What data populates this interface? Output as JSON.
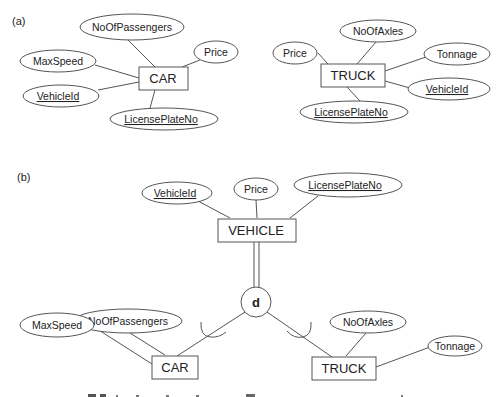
{
  "diagram": {
    "part_a": {
      "label": "(a)",
      "car": {
        "name": "CAR",
        "attributes": {
          "no_of_passengers": "NoOfPassengers",
          "max_speed": "MaxSpeed",
          "price": "Price",
          "vehicle_id": "VehicleId",
          "license_plate_no": "LicensePlateNo"
        },
        "key_attributes": [
          "VehicleId",
          "LicensePlateNo"
        ]
      },
      "truck": {
        "name": "TRUCK",
        "attributes": {
          "price": "Price",
          "no_of_axles": "NoOfAxles",
          "tonnage": "Tonnage",
          "vehicle_id": "VehicleId",
          "license_plate_no": "LicensePlateNo"
        },
        "key_attributes": [
          "VehicleId",
          "LicensePlateNo"
        ]
      }
    },
    "part_b": {
      "label": "(b)",
      "vehicle": {
        "name": "VEHICLE",
        "attributes": {
          "vehicle_id": "VehicleId",
          "price": "Price",
          "license_plate_no": "LicensePlateNo"
        },
        "key_attributes": [
          "VehicleId",
          "LicensePlateNo"
        ]
      },
      "specialization": {
        "symbol": "d",
        "meaning": "disjoint",
        "participation": "total"
      },
      "car": {
        "name": "CAR",
        "attributes": {
          "no_of_passengers": "NoOfPassengers",
          "max_speed": "MaxSpeed"
        }
      },
      "truck": {
        "name": "TRUCK",
        "attributes": {
          "no_of_axles": "NoOfAxles",
          "tonnage": "Tonnage"
        }
      }
    }
  }
}
